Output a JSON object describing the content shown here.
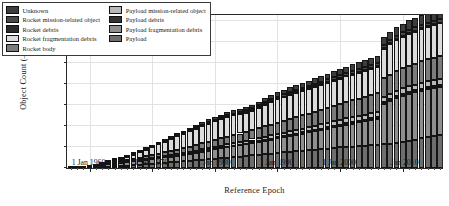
{
  "chart_data": {
    "type": "bar",
    "stacked": true,
    "title": "",
    "xlabel": "Reference Epoch",
    "ylabel": "Object Count (–)",
    "ylim": [
      0,
      18500
    ],
    "ytick_labels": [
      "0",
      "2500",
      "5000",
      "7500",
      "10,000",
      "12,500",
      "15,000",
      "17,500"
    ],
    "ytick_values": [
      0,
      2500,
      5000,
      7500,
      10000,
      12500,
      15000,
      17500
    ],
    "xtick_labels": [
      "1 Jan 1960",
      "1 Jan 1970",
      "1 Jan 1980",
      "1 Jan 1990",
      "1 Jan 2000",
      "1 Jan 2010"
    ],
    "xtick_values": [
      1960,
      1970,
      1980,
      1990,
      2000,
      2010
    ],
    "xlim": [
      1956.4,
      2016.6
    ],
    "grid": true,
    "legend_position": "upper-left",
    "legend_columns": 2,
    "categories": [
      1957,
      1958,
      1959,
      1960,
      1961,
      1962,
      1963,
      1964,
      1965,
      1966,
      1967,
      1968,
      1969,
      1970,
      1971,
      1972,
      1973,
      1974,
      1975,
      1976,
      1977,
      1978,
      1979,
      1980,
      1981,
      1982,
      1983,
      1984,
      1985,
      1986,
      1987,
      1988,
      1989,
      1990,
      1991,
      1992,
      1993,
      1994,
      1995,
      1996,
      1997,
      1998,
      1999,
      2000,
      2001,
      2002,
      2003,
      2004,
      2005,
      2006,
      2007,
      2008,
      2009,
      2010,
      2011,
      2012,
      2013,
      2014,
      2015,
      2016
    ],
    "series": [
      {
        "name": "Payload",
        "color": "#6e6e6e",
        "values": [
          2,
          10,
          18,
          35,
          60,
          110,
          150,
          200,
          250,
          300,
          360,
          410,
          460,
          520,
          580,
          640,
          700,
          760,
          820,
          880,
          940,
          1010,
          1070,
          1130,
          1190,
          1250,
          1310,
          1370,
          1440,
          1510,
          1580,
          1650,
          1720,
          1800,
          1880,
          1950,
          2010,
          2070,
          2130,
          2190,
          2250,
          2320,
          2390,
          2450,
          2510,
          2560,
          2610,
          2660,
          2710,
          2770,
          2840,
          2920,
          3010,
          3120,
          3250,
          3400,
          3560,
          3700,
          3830,
          3950
        ]
      },
      {
        "name": "Payload fragmentation debris",
        "color": "#8f8f8f",
        "values": [
          0,
          1,
          2,
          5,
          60,
          260,
          300,
          330,
          360,
          390,
          420,
          460,
          500,
          540,
          580,
          620,
          660,
          700,
          760,
          820,
          880,
          950,
          1020,
          1090,
          1150,
          1210,
          1270,
          1330,
          1390,
          1450,
          1520,
          1590,
          1660,
          1730,
          1800,
          1870,
          1950,
          2030,
          2110,
          2200,
          2290,
          2380,
          2470,
          2560,
          2660,
          2750,
          2840,
          2930,
          3030,
          3130,
          4800,
          5100,
          5350,
          5500,
          5600,
          5650,
          5680,
          5700,
          5720,
          5740
        ]
      },
      {
        "name": "Payload debris",
        "color": "#333333",
        "values": [
          0,
          0,
          0,
          0,
          0,
          0,
          0,
          0,
          0,
          0,
          5,
          10,
          15,
          20,
          25,
          30,
          35,
          40,
          45,
          50,
          55,
          60,
          65,
          70,
          75,
          80,
          85,
          90,
          95,
          100,
          105,
          110,
          115,
          120,
          125,
          130,
          135,
          140,
          145,
          150,
          155,
          160,
          165,
          170,
          175,
          180,
          185,
          190,
          195,
          200,
          205,
          210,
          215,
          220,
          225,
          230,
          235,
          240,
          245,
          250
        ]
      },
      {
        "name": "Payload mission-related object",
        "color": "#b8b8b8",
        "values": [
          0,
          0,
          0,
          2,
          5,
          10,
          20,
          30,
          40,
          50,
          60,
          75,
          90,
          105,
          120,
          135,
          150,
          165,
          180,
          195,
          210,
          225,
          240,
          255,
          270,
          285,
          300,
          315,
          330,
          345,
          360,
          375,
          390,
          405,
          420,
          435,
          450,
          465,
          480,
          495,
          510,
          525,
          540,
          555,
          570,
          580,
          590,
          600,
          610,
          620,
          630,
          640,
          650,
          660,
          670,
          680,
          690,
          700,
          710,
          720
        ]
      },
      {
        "name": "Rocket body",
        "color": "#7c7c7c",
        "values": [
          2,
          6,
          12,
          24,
          45,
          80,
          110,
          140,
          175,
          210,
          245,
          285,
          325,
          365,
          405,
          445,
          485,
          530,
          575,
          620,
          665,
          715,
          765,
          815,
          865,
          915,
          965,
          1015,
          1070,
          1125,
          1180,
          1235,
          1290,
          1350,
          1410,
          1465,
          1520,
          1575,
          1630,
          1685,
          1740,
          1795,
          1850,
          1900,
          1950,
          1995,
          2040,
          2085,
          2130,
          2180,
          2230,
          2280,
          2330,
          2385,
          2440,
          2500,
          2560,
          2620,
          2680,
          2740
        ]
      },
      {
        "name": "Rocket fragmentation debris",
        "color": "#dcdcdc",
        "values": [
          0,
          0,
          2,
          6,
          20,
          60,
          120,
          190,
          280,
          380,
          500,
          640,
          790,
          950,
          1110,
          1270,
          1430,
          1580,
          1720,
          1850,
          1960,
          2060,
          2150,
          2230,
          2290,
          2330,
          2340,
          2320,
          2300,
          2330,
          2450,
          2600,
          2720,
          2800,
          2850,
          2880,
          2900,
          2920,
          2940,
          2960,
          2980,
          3000,
          3020,
          3040,
          3060,
          3080,
          3100,
          3120,
          3140,
          3160,
          3500,
          3650,
          3750,
          3800,
          3820,
          3830,
          3840,
          3845,
          3850,
          3855
        ]
      },
      {
        "name": "Rocket debris",
        "color": "#2b2b2b",
        "values": [
          0,
          0,
          0,
          0,
          0,
          0,
          0,
          0,
          0,
          0,
          0,
          2,
          4,
          6,
          8,
          10,
          12,
          14,
          16,
          18,
          20,
          22,
          24,
          26,
          28,
          30,
          32,
          34,
          36,
          38,
          40,
          42,
          44,
          46,
          48,
          50,
          52,
          54,
          56,
          58,
          60,
          62,
          64,
          66,
          68,
          70,
          72,
          74,
          76,
          78,
          80,
          82,
          84,
          86,
          88,
          90,
          92,
          94,
          96,
          98
        ]
      },
      {
        "name": "Rocket mission-related object",
        "color": "#4a4a4a",
        "values": [
          0,
          0,
          0,
          0,
          2,
          5,
          10,
          15,
          20,
          25,
          30,
          40,
          50,
          60,
          70,
          80,
          90,
          100,
          110,
          120,
          130,
          140,
          150,
          160,
          170,
          180,
          190,
          200,
          210,
          220,
          230,
          240,
          250,
          260,
          270,
          280,
          290,
          300,
          310,
          320,
          330,
          340,
          350,
          360,
          370,
          375,
          380,
          385,
          390,
          395,
          400,
          405,
          410,
          415,
          420,
          425,
          430,
          435,
          440,
          445
        ]
      },
      {
        "name": "Unknown",
        "color": "#3d3d3d",
        "values": [
          0,
          0,
          0,
          0,
          3,
          8,
          15,
          25,
          40,
          55,
          70,
          90,
          110,
          130,
          150,
          170,
          190,
          210,
          230,
          250,
          270,
          290,
          310,
          330,
          350,
          370,
          390,
          410,
          430,
          450,
          470,
          490,
          510,
          530,
          550,
          570,
          590,
          610,
          630,
          650,
          670,
          690,
          710,
          730,
          750,
          770,
          790,
          810,
          830,
          850,
          900,
          950,
          1000,
          1050,
          1100,
          1150,
          1200,
          1250,
          1300,
          1350
        ]
      }
    ]
  },
  "legend": {
    "column1": [
      {
        "label": "Unknown",
        "color": "#3d3d3d"
      },
      {
        "label": "Rocket mission-related object",
        "color": "#4a4a4a"
      },
      {
        "label": "Rocket debris",
        "color": "#2b2b2b"
      },
      {
        "label": "Rocket fragmentation debris",
        "color": "#dcdcdc"
      },
      {
        "label": "Rocket body",
        "color": "#7c7c7c"
      }
    ],
    "column2": [
      {
        "label": "Payload mission-related object",
        "color": "#b8b8b8"
      },
      {
        "label": "Payload debris",
        "color": "#333333"
      },
      {
        "label": "Payload fragmentation debris",
        "color": "#8f8f8f"
      },
      {
        "label": "Payload",
        "color": "#6e6e6e"
      }
    ]
  }
}
